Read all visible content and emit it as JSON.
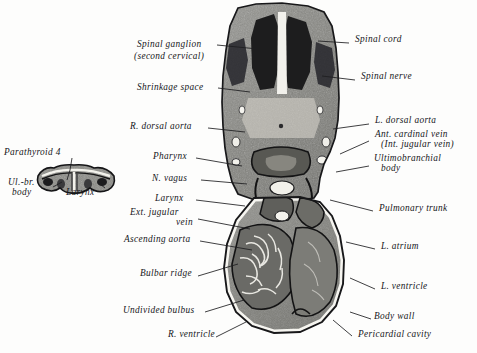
{
  "figure": {
    "background_color": "#fdfdfc",
    "ink_color": "#15161a",
    "caption_cut_off": ""
  },
  "inset": {
    "labels": [
      {
        "text": "Parathyroid 4",
        "x": 4,
        "y": 152
      },
      {
        "text": "Ul.-br.",
        "x": 8,
        "y": 182
      },
      {
        "text": "body",
        "x": 12,
        "y": 192
      },
      {
        "text": "Larynx",
        "x": 66,
        "y": 192
      }
    ]
  },
  "labels_left": [
    {
      "text": "Spinal ganglion",
      "x": 137,
      "y": 44
    },
    {
      "text": "(second cervical)",
      "x": 134,
      "y": 56
    },
    {
      "text": "Shrinkage space",
      "x": 137,
      "y": 87
    },
    {
      "text": "R. dorsal aorta",
      "x": 130,
      "y": 126
    },
    {
      "text": "Pharynx",
      "x": 153,
      "y": 156
    },
    {
      "text": "N. vagus",
      "x": 152,
      "y": 178
    },
    {
      "text": "Larynx",
      "x": 155,
      "y": 198
    },
    {
      "text": "Ext. jugular",
      "x": 130,
      "y": 212
    },
    {
      "text": "vein",
      "x": 176,
      "y": 222
    },
    {
      "text": "Ascending aorta",
      "x": 124,
      "y": 239
    },
    {
      "text": "Bulbar ridge",
      "x": 140,
      "y": 273
    },
    {
      "text": "Undivided bulbus",
      "x": 123,
      "y": 310
    },
    {
      "text": "R. ventricle",
      "x": 168,
      "y": 334
    }
  ],
  "labels_right": [
    {
      "text": "Spinal cord",
      "x": 355,
      "y": 39
    },
    {
      "text": "Spinal nerve",
      "x": 361,
      "y": 76
    },
    {
      "text": "L. dorsal aorta",
      "x": 375,
      "y": 120
    },
    {
      "text": "Ant. cardinal vein",
      "x": 375,
      "y": 134
    },
    {
      "text": "(Int. jugular vein)",
      "x": 381,
      "y": 144
    },
    {
      "text": "Ultimobranchial",
      "x": 374,
      "y": 158
    },
    {
      "text": "body",
      "x": 381,
      "y": 168
    },
    {
      "text": "Pulmonary trunk",
      "x": 379,
      "y": 208
    },
    {
      "text": "L. atrium",
      "x": 381,
      "y": 246
    },
    {
      "text": "L. ventricle",
      "x": 381,
      "y": 286
    },
    {
      "text": "Body wall",
      "x": 374,
      "y": 316
    },
    {
      "text": "Pericardial cavity",
      "x": 358,
      "y": 334
    }
  ]
}
